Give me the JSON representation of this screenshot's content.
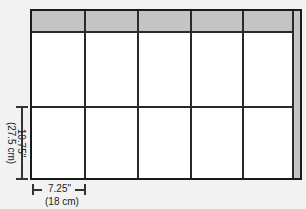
{
  "diagram": {
    "type": "grid-layout",
    "columns": 5,
    "rows": 2,
    "header_row": true,
    "right_strip": true,
    "colors": {
      "fill_shaded": "#c4c4c4",
      "line": "#2a2a2a",
      "background": "#ffffff"
    }
  },
  "dimensions": {
    "height": {
      "inches": "10.75\"",
      "cm": "(27.5 cm)"
    },
    "width": {
      "inches": "7.25\"",
      "cm": "(18 cm)"
    }
  }
}
